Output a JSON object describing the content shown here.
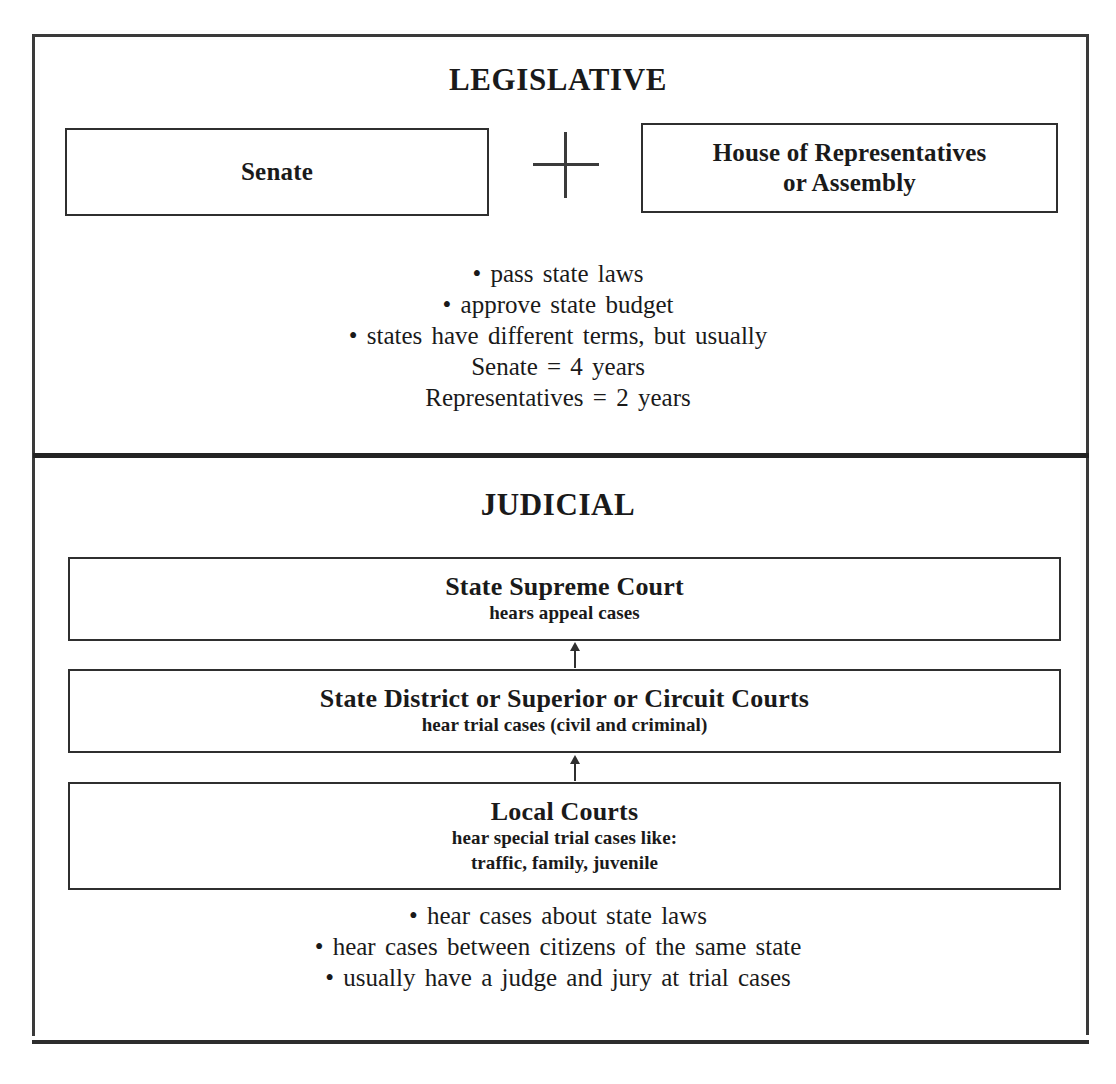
{
  "document": {
    "title": "State Government: Legislative and Judicial Branches"
  },
  "legislative": {
    "heading": "LEGISLATIVE",
    "chambers": [
      {
        "name": "senate",
        "label": "Senate"
      },
      {
        "name": "house",
        "line1": "House of Representatives",
        "line2": "or Assembly"
      }
    ],
    "connector": "plus-sign",
    "bullets": [
      "• pass state laws",
      "• approve state budget",
      "• states have different terms, but usually",
      "Senate  =  4 years",
      "Representatives  =  2 years"
    ]
  },
  "judicial": {
    "heading": "JUDICIAL",
    "courts": [
      {
        "name": "state-supreme-court",
        "title": "State Supreme Court",
        "sub1": "hears appeal cases",
        "sub2": ""
      },
      {
        "name": "state-district-court",
        "title": "State District or Superior or Circuit Courts",
        "sub1": "hear trial cases (civil and criminal)",
        "sub2": ""
      },
      {
        "name": "local-courts",
        "title": "Local Courts",
        "sub1": "hear special trial cases like:",
        "sub2": "traffic, family, juvenile"
      }
    ],
    "bullets": [
      "• hear cases about state laws",
      "• hear cases between citizens of the same state",
      "• usually have a judge and jury at trial cases"
    ]
  },
  "colors": {
    "ink": "#1a1a1a",
    "border": "#2f2f2f",
    "background": "#ffffff"
  }
}
